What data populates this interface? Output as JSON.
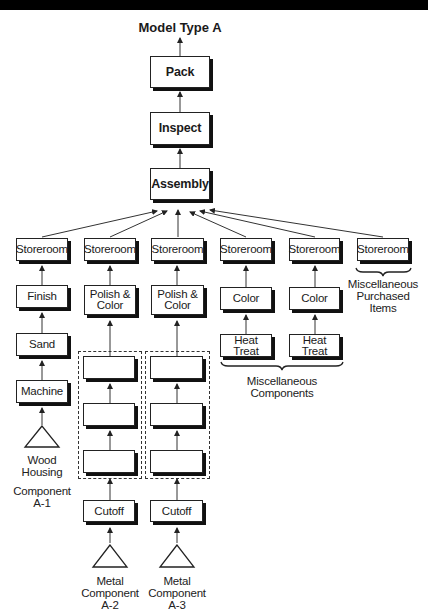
{
  "diagram": {
    "title": "Model Type A",
    "main_chain": [
      "Pack",
      "Inspect",
      "Assembly"
    ],
    "storeroom_label": "Storeroom",
    "columns": [
      {
        "id": "a1",
        "steps": [
          "Storeroom",
          "Finish",
          "Sand",
          "Machine"
        ],
        "source_label": "Wood Housing",
        "component_label": "Component A-1"
      },
      {
        "id": "a2",
        "steps": [
          "Storeroom",
          "Polish & Color",
          "",
          "",
          "",
          "Cutoff"
        ],
        "source_label": "Metal Component A-2"
      },
      {
        "id": "a3",
        "steps": [
          "Storeroom",
          "Polish & Color",
          "",
          "",
          "",
          "Cutoff"
        ],
        "source_label": "Metal Component A-3"
      },
      {
        "id": "m1",
        "steps": [
          "Storeroom",
          "Color",
          "Heat Treat"
        ]
      },
      {
        "id": "m2",
        "steps": [
          "Storeroom",
          "Color",
          "Heat Treat"
        ]
      },
      {
        "id": "p1",
        "steps": [
          "Storeroom"
        ]
      }
    ],
    "brace_labels": {
      "misc_components": "Miscellaneous Components",
      "misc_purchased": "Miscellaneous Purchased Items"
    },
    "text": {
      "pack": "Pack",
      "inspect": "Inspect",
      "assembly": "Assembly",
      "storeroom": "Storeroom",
      "finish": "Finish",
      "sand": "Sand",
      "machine": "Machine",
      "polish_color_1": "Polish &",
      "polish_color_2": "Color",
      "color": "Color",
      "heat_treat": "Heat Treat",
      "cutoff": "Cutoff",
      "wood_1": "Wood",
      "wood_2": "Housing",
      "comp_a1_1": "Component",
      "comp_a1_2": "A-1",
      "metal": "Metal",
      "component": "Component",
      "a2": "A-2",
      "a3": "A-3",
      "misc": "Miscellaneous",
      "purchased": "Purchased",
      "items": "Items",
      "components": "Components"
    }
  }
}
